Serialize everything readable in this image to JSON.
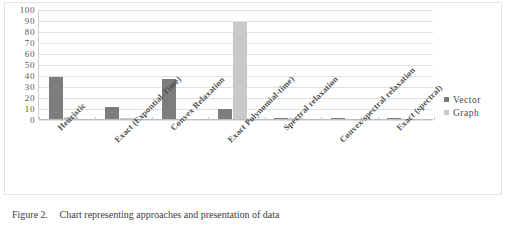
{
  "caption": {
    "number": "Figure 2.",
    "text": "Chart representing approaches and presentation of data"
  },
  "legend": {
    "position": "right",
    "items": [
      {
        "label": "Vector",
        "color": "#7d7d7d",
        "marker": "square-swatch-icon"
      },
      {
        "label": "Graph",
        "color": "#c9c9c9",
        "marker": "square-swatch-icon"
      }
    ]
  },
  "chart_data": {
    "type": "bar",
    "title": "",
    "xlabel": "",
    "ylabel": "",
    "ylim": [
      0,
      100
    ],
    "yticks": [
      0,
      10,
      20,
      30,
      40,
      50,
      60,
      70,
      80,
      90,
      100
    ],
    "ytick_labels": [
      "0",
      "10",
      "20",
      "30",
      "40",
      "50",
      "60",
      "70",
      "80",
      "90",
      "100"
    ],
    "grid": true,
    "grid_axis": "y",
    "categories": [
      "Heuristic",
      "Exact (Expontial-Time)",
      "Convex Relaxation",
      "Exact Polynomial-time)",
      "Spectral relaxation",
      "Convex/spectral relaxation",
      "Exact (spectral)"
    ],
    "series": [
      {
        "name": "Vector",
        "color": "#7d7d7d",
        "values": [
          38,
          11,
          36,
          9,
          1,
          1,
          1
        ]
      },
      {
        "name": "Graph",
        "color": "#c9c9c9",
        "values": [
          2,
          1,
          0,
          88,
          1,
          0,
          0
        ]
      }
    ]
  }
}
